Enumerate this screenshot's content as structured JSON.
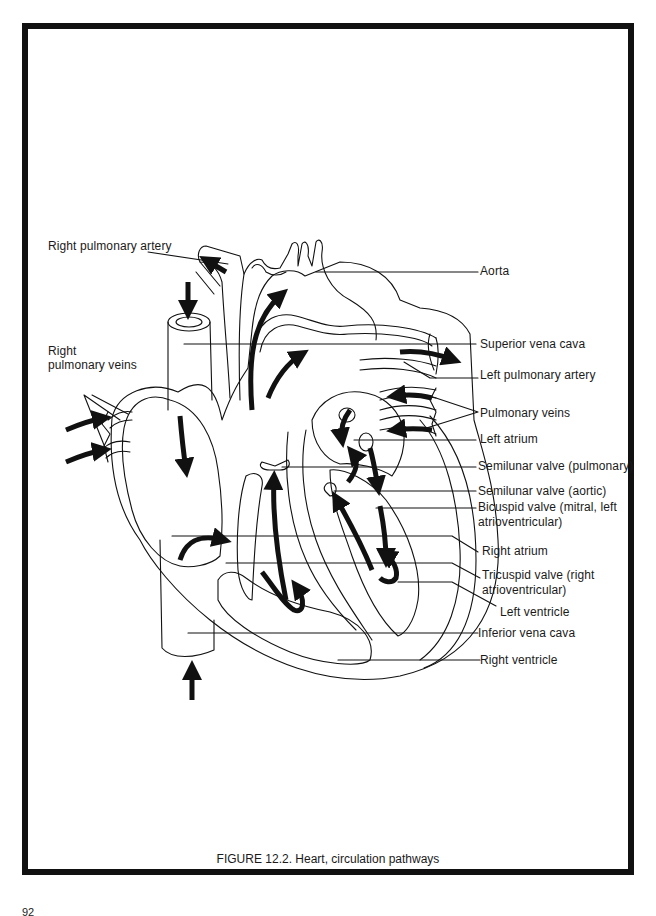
{
  "figure": {
    "caption": "FIGURE 12.2. Heart, circulation pathways",
    "page_number": "92"
  },
  "labels": {
    "right_pulmonary_artery": "Right pulmonary artery",
    "right_pulmonary_veins_1": "Right",
    "right_pulmonary_veins_2": "pulmonary veins",
    "aorta": "Aorta",
    "superior_vena_cava": "Superior vena cava",
    "left_pulmonary_artery": "Left pulmonary artery",
    "pulmonary_veins": "Pulmonary veins",
    "left_atrium": "Left atrium",
    "semilunar_pulmonary": "Semilunar valve (pulmonary)",
    "semilunar_aortic": "Semilunar valve (aortic)",
    "bicuspid_1": "Bicuspid valve (mitral, left",
    "bicuspid_2": "atrioventricular)",
    "right_atrium": "Right atrium",
    "tricuspid_1": "Tricuspid valve (right",
    "tricuspid_2": "atrioventricular)",
    "left_ventricle": "Left ventricle",
    "inferior_vena_cava": "Inferior vena cava",
    "right_ventricle": "Right ventricle"
  },
  "colors": {
    "ink": "#111111",
    "paper": "#ffffff"
  }
}
